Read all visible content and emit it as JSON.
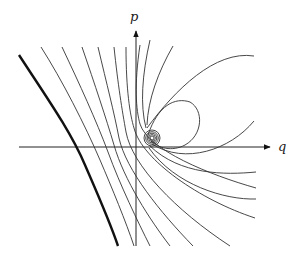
{
  "figure": {
    "type": "phase-portrait",
    "axes": {
      "vertical_label": "p",
      "horizontal_label": "q"
    },
    "colors": {
      "line": "#333333",
      "thick_curve": "#111111",
      "background": "#ffffff"
    },
    "elements": {
      "spiral_focus": "spiral point near origin on positive q side",
      "thick_curve": "separatrix on the left",
      "trajectories": "family of curves fanning from top-left to bottom-right, closed loop above q-axis"
    }
  }
}
